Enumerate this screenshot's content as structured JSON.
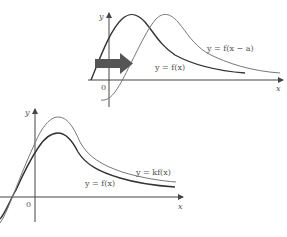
{
  "diagram": {
    "colors": {
      "background": "#ffffff",
      "axis": "#444444",
      "curve_dark": "#333333",
      "curve_light": "#777777",
      "arrow": "#555555",
      "label": "#555555"
    },
    "top_graph": {
      "description": "Horizontal translation",
      "axis_labels": {
        "y": "y",
        "x": "x",
        "origin": "0"
      },
      "curves": [
        {
          "id": "f",
          "label": "y = f(x)"
        },
        {
          "id": "f_shift",
          "label": "y = f(x − a)"
        }
      ],
      "arrow_direction": "right"
    },
    "bottom_graph": {
      "description": "Vertical stretch",
      "axis_labels": {
        "y": "y",
        "x": "x",
        "origin": "0"
      },
      "curves": [
        {
          "id": "f",
          "label": "y = f(x)"
        },
        {
          "id": "kf",
          "label": "y = kf(x)"
        }
      ]
    }
  }
}
